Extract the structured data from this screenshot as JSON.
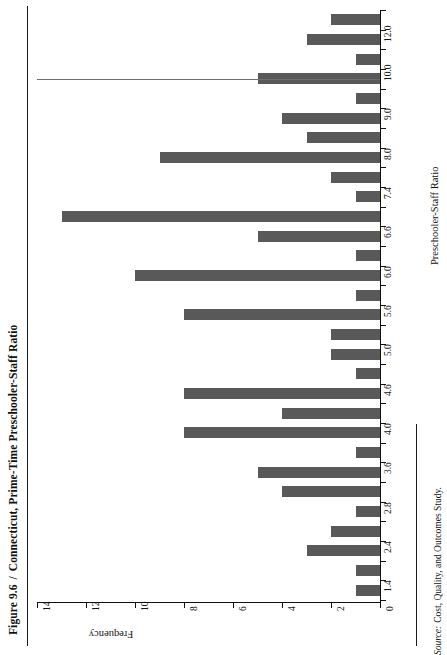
{
  "figure": {
    "number": "Figure 9.6",
    "separator": "/",
    "title": "Connecticut, Prime-Time Preschooler-Staff Ratio"
  },
  "source": {
    "label": "Source:",
    "text": "Cost, Quality, and Outcomes Study."
  },
  "colors": {
    "bar": "#595959",
    "axis": "#111111",
    "background": "#ffffff"
  },
  "chart_data": {
    "type": "bar",
    "orientation": "horizontal-rotated",
    "title": "Connecticut, Prime-Time Preschooler-Staff Ratio",
    "xlabel": "Preschooler-Staff Ratio",
    "ylabel": "Frequency",
    "ylim": [
      0,
      14
    ],
    "yticks": [
      0,
      2,
      4,
      6,
      8,
      10,
      12,
      14
    ],
    "ytick_labels": [
      "0",
      "2",
      "4",
      "6",
      "8",
      "10",
      "12",
      "14"
    ],
    "grid": false,
    "legend": null,
    "categories": [
      "1.4",
      "",
      "2.4",
      "",
      "2.8",
      "",
      "3.6",
      "",
      "4.0",
      "",
      "4.6",
      "",
      "5.0",
      "",
      "5.6",
      "",
      "6.0",
      "",
      "6.6",
      "",
      "7.4",
      "",
      "8.0",
      "",
      "9.0",
      "",
      "10.0",
      "",
      "12.0",
      ""
    ],
    "tick_labels": [
      "1.4",
      "2.4",
      "2.8",
      "3.6",
      "4.0",
      "4.6",
      "5.0",
      "5.6",
      "6.0",
      "6.6",
      "7.4",
      "8.0",
      "9.0",
      "10.0",
      "12.0"
    ],
    "bars": [
      {
        "category": "12.0b",
        "value": 2
      },
      {
        "category": "12.0",
        "value": 3
      },
      {
        "category": "11.0",
        "value": 1
      },
      {
        "category": "10.0",
        "value": 5
      },
      {
        "category": "9.5",
        "value": 1
      },
      {
        "category": "9.0",
        "value": 4
      },
      {
        "category": "8.5",
        "value": 3
      },
      {
        "category": "8.0",
        "value": 9
      },
      {
        "category": "7.7",
        "value": 2
      },
      {
        "category": "7.4",
        "value": 1
      },
      {
        "category": "7.0",
        "value": 13
      },
      {
        "category": "6.6",
        "value": 5
      },
      {
        "category": "6.3",
        "value": 1
      },
      {
        "category": "6.0",
        "value": 10
      },
      {
        "category": "5.8",
        "value": 1
      },
      {
        "category": "5.6",
        "value": 8
      },
      {
        "category": "5.3",
        "value": 2
      },
      {
        "category": "5.0",
        "value": 2
      },
      {
        "category": "4.8",
        "value": 1
      },
      {
        "category": "4.6",
        "value": 8
      },
      {
        "category": "4.3",
        "value": 4
      },
      {
        "category": "4.0",
        "value": 8
      },
      {
        "category": "3.8",
        "value": 1
      },
      {
        "category": "3.6",
        "value": 5
      },
      {
        "category": "3.2",
        "value": 4
      },
      {
        "category": "2.8",
        "value": 1
      },
      {
        "category": "2.6",
        "value": 2
      },
      {
        "category": "2.4",
        "value": 3
      },
      {
        "category": "1.8",
        "value": 1
      },
      {
        "category": "1.4",
        "value": 1
      }
    ],
    "values": [
      2,
      3,
      1,
      5,
      1,
      4,
      3,
      9,
      2,
      1,
      13,
      5,
      1,
      10,
      1,
      8,
      2,
      2,
      1,
      8,
      4,
      8,
      1,
      5,
      4,
      1,
      2,
      3,
      1,
      1
    ]
  }
}
